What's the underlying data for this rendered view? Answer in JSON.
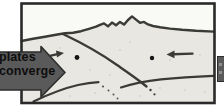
{
  "labels": {
    "left_arrow": "plates converge"
  },
  "arrows": {
    "big_left": {
      "direction": "right",
      "label": "plates converge"
    },
    "big_right_clipped": {
      "direction": "left"
    },
    "small_upper_left": {
      "direction": "right"
    },
    "small_upper_right": {
      "direction": "left"
    }
  },
  "markers": {
    "left_dot": {
      "cx": 77,
      "cy": 57.5
    },
    "right_dot": {
      "cx": 152,
      "cy": 58
    }
  },
  "colors": {
    "frame": "#2a2a2a",
    "line": "#3a3a36",
    "arrow_fill": "#5a5a5a",
    "arrow_outline": "#2d2d2d",
    "ground": "#e9e7e2",
    "sky": "#f9f9f6",
    "dot": "#141414",
    "label_text": "#0e0e0e"
  }
}
